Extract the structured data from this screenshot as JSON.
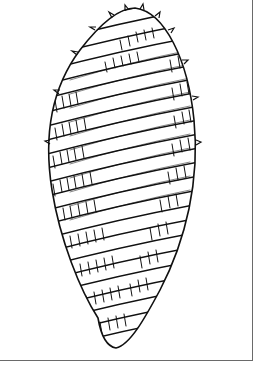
{
  "figure": {
    "style": "black line illustration on white",
    "frame": {
      "right_border": true,
      "bottom_border": true,
      "border_color": "#6a6a6a"
    },
    "ink_color": "#111111",
    "background_color": "#ffffff",
    "caption": ""
  }
}
